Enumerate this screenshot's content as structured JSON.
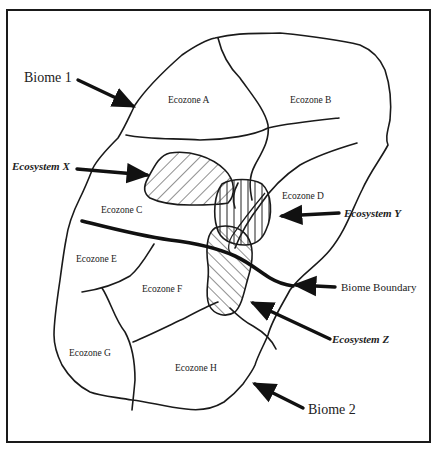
{
  "diagram": {
    "type": "ecological-hierarchy-map",
    "frame": {
      "stroke": "#1a1a1a",
      "background": "#ffffff"
    },
    "biomes": [
      {
        "label": "Biome 1"
      },
      {
        "label": "Biome 2"
      }
    ],
    "boundary": {
      "label": "Biome Boundary"
    },
    "ecozones": [
      {
        "label": "Ecozone A"
      },
      {
        "label": "Ecozone B"
      },
      {
        "label": "Ecozone C"
      },
      {
        "label": "Ecozone D"
      },
      {
        "label": "Ecozone E"
      },
      {
        "label": "Ecozone F"
      },
      {
        "label": "Ecozone G"
      },
      {
        "label": "Ecozone H"
      }
    ],
    "ecosystems": [
      {
        "label": "Ecosystem X",
        "hatch": "diagonal-down"
      },
      {
        "label": "Ecosystem Y",
        "hatch": "vertical"
      },
      {
        "label": "Ecosystem Z",
        "hatch": "diagonal-up"
      }
    ]
  }
}
